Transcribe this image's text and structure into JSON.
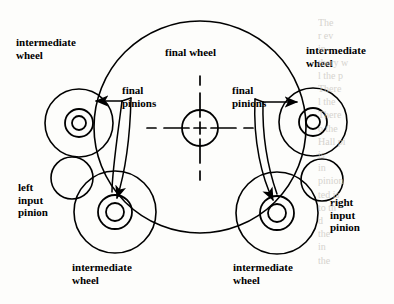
{
  "figure": {
    "background_color": "#fdfdfb",
    "line_color": "#000000",
    "line_width": 1.6
  },
  "labels": {
    "intermediate_wheel_top_left": "intermediate\nwheel",
    "intermediate_wheel_top_right": "intermediate\nwheel",
    "intermediate_wheel_bottom_left": "intermediate\nwheel",
    "intermediate_wheel_bottom_right": "intermediate\nwheel",
    "final_wheel": "final wheel",
    "final_pinions_left": "final\npinions",
    "final_pinions_right": "final\npinions",
    "left_input_pinion": "left\ninput\npinion",
    "right_input_pinion": "right\ninput\npinion"
  },
  "bleed_through": {
    "right_column": "The \nr ev\nin\nthery w\nl the p\nThere\nl the\nThere\no the\nHall pi\nis\nin\npinion\nted is\nto th\nd\nthe\nin\nthe",
    "bottom_strip": ""
  },
  "geometry": {
    "final_wheel": {
      "cx": 200,
      "cy": 127,
      "r": 106,
      "label": "final wheel outer pitch circle"
    },
    "final_wheel_hub": {
      "cx": 200,
      "cy": 128,
      "r": 18
    },
    "centerline_horizontal": {
      "y": 128,
      "x1": 147,
      "x2": 253
    },
    "centerline_vertical": {
      "x": 200,
      "y1": 76,
      "y2": 180
    },
    "wheels": [
      {
        "name": "intermediate-wheel-top-left",
        "cx": 79,
        "cy": 123,
        "r_outer": 34,
        "r_mid": 14,
        "r_inner": 7
      },
      {
        "name": "intermediate-wheel-top-right",
        "cx": 313,
        "cy": 122,
        "r_outer": 34,
        "r_mid": 14,
        "r_inner": 7
      },
      {
        "name": "intermediate-wheel-bottom-left",
        "cx": 115,
        "cy": 212,
        "r_outer": 41,
        "r_mid": 17,
        "r_inner": 9
      },
      {
        "name": "intermediate-wheel-bottom-right",
        "cx": 277,
        "cy": 213,
        "r_outer": 41,
        "r_mid": 17,
        "r_inner": 9
      }
    ],
    "input_pinions": [
      {
        "name": "left-input-pinion",
        "cx": 72,
        "cy": 178,
        "r": 21
      },
      {
        "name": "right-input-pinion",
        "cx": 322,
        "cy": 180,
        "r": 21
      }
    ]
  }
}
